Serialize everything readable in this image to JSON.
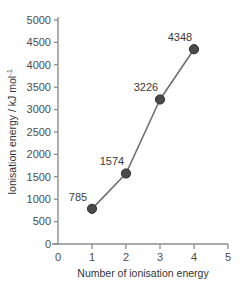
{
  "chart_data": {
    "type": "line",
    "title": "",
    "xlabel": "Number of ionisation energy",
    "ylabel": "Ionisation energy / kJ mol",
    "ylabel_superscript": "-1",
    "x": [
      1,
      2,
      3,
      4
    ],
    "values": [
      785,
      1574,
      3226,
      4348
    ],
    "point_labels": [
      "785",
      "1574",
      "3226",
      "4348"
    ],
    "xlim": [
      0,
      5
    ],
    "ylim": [
      0,
      5000
    ],
    "xticks": [
      "0",
      "1",
      "2",
      "3",
      "4",
      "5"
    ],
    "xtick_values": [
      0,
      1,
      2,
      3,
      4,
      5
    ],
    "yticks": [
      "0",
      "500",
      "1000",
      "1500",
      "2000",
      "2500",
      "3000",
      "3500",
      "4000",
      "4500",
      "5000"
    ],
    "ytick_values": [
      0,
      500,
      1000,
      1500,
      2000,
      2500,
      3000,
      3500,
      4000,
      4500,
      5000
    ],
    "grid": false,
    "legend": false,
    "colors": {
      "line": "#6e6e6e",
      "marker_fill": "#4a4a4a",
      "marker_stroke": "#2f2f2f",
      "axis": "#8c8c8c",
      "tick_text": "#4d4d4d",
      "label_text": "#3a3a3a",
      "background": "#ffffff"
    }
  }
}
